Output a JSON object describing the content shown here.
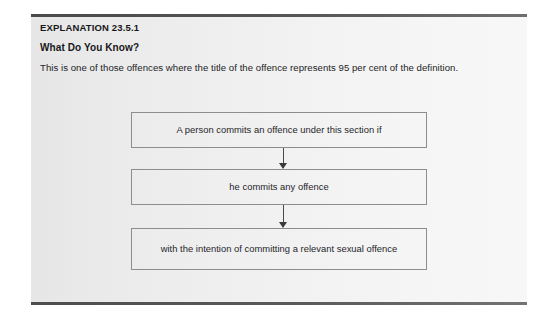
{
  "panel": {
    "explanation_title": "EXPLANATION 23.5.1",
    "subheading": "What Do You Know?",
    "body_text": "This is one of those offences where the title of the offence represents 95 per cent of the definition."
  },
  "flowchart": {
    "type": "flow",
    "orientation": "vertical",
    "steps": [
      {
        "id": "step-1",
        "label": "A person commits an offence under this section if"
      },
      {
        "id": "step-2",
        "label": "he commits any offence"
      },
      {
        "id": "step-3",
        "label": "with the intention of committing a relevant sexual offence"
      }
    ],
    "connectors": [
      {
        "id": "connector-1",
        "from": "step-1",
        "to": "step-2",
        "arrow": "down-arrow-icon"
      },
      {
        "id": "connector-2",
        "from": "step-2",
        "to": "step-3",
        "arrow": "down-arrow-icon"
      }
    ]
  },
  "colors": {
    "panel_background_left": "#e6e6e6",
    "panel_background_right": "#f7f7f7",
    "rule": "#4a4a4a",
    "box_border": "#8d8d8d",
    "heading_text": "#17171a",
    "body_text": "#232326"
  }
}
